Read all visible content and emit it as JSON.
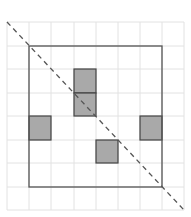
{
  "diagram": {
    "grid": {
      "columns": 8,
      "rows": 8,
      "x_lines": [
        7,
        29,
        51,
        74,
        96,
        118,
        140,
        162,
        184
      ],
      "y_lines": [
        22,
        46,
        69,
        93,
        116,
        140,
        163,
        187,
        210
      ],
      "color": "#e2e2e2"
    },
    "outer_square": {
      "col_start": 1,
      "row_start": 1,
      "col_end": 7,
      "row_end": 7,
      "color": "#555555"
    },
    "shaded_cells": [
      {
        "col": 3,
        "row": 2
      },
      {
        "col": 3,
        "row": 3
      },
      {
        "col": 1,
        "row": 4
      },
      {
        "col": 6,
        "row": 4
      },
      {
        "col": 4,
        "row": 5
      }
    ],
    "shade_fill": "#a9a9a9",
    "shade_stroke": "#444444",
    "diagonal": {
      "x1": 7,
      "y1": 22,
      "x2": 184,
      "y2": 210,
      "dash": "5,4",
      "color": "#555555"
    }
  }
}
